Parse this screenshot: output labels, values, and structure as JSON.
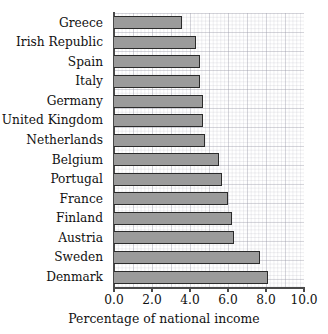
{
  "chart_data": {
    "type": "bar",
    "orientation": "horizontal",
    "title": "",
    "xlabel": "Percentage of national income",
    "ylabel": "",
    "xlim": [
      0.0,
      10.0
    ],
    "xticks": [
      "0.0",
      "2.0",
      "4.0",
      "6.0",
      "8.0",
      "10.0"
    ],
    "xtick_values": [
      0.0,
      2.0,
      4.0,
      6.0,
      8.0,
      10.0
    ],
    "grid": true,
    "legend": "none",
    "categories": [
      "Greece",
      "Irish Republic",
      "Spain",
      "Italy",
      "Germany",
      "United Kingdom",
      "Netherlands",
      "Belgium",
      "Portugal",
      "France",
      "Finland",
      "Austria",
      "Sweden",
      "Denmark"
    ],
    "values": [
      3.6,
      4.3,
      4.5,
      4.5,
      4.7,
      4.7,
      4.8,
      5.5,
      5.7,
      6.0,
      6.2,
      6.3,
      7.7,
      8.1
    ],
    "colors": {
      "bar_fill": "#9b9b9b",
      "bar_edge": "#2b2b2b",
      "grid": "#9696a5",
      "axis": "#4a4a4a",
      "text": "#111111",
      "background": "#ffffff"
    }
  }
}
